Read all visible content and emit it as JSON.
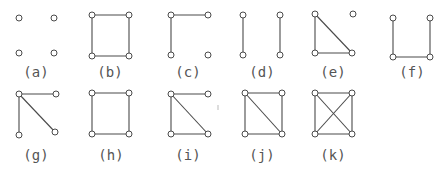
{
  "diagram": {
    "title": "",
    "node_radius": 3,
    "colors": {
      "stroke": "#4a4a4a",
      "node_fill": "#ffffff",
      "label": "#555555",
      "background": "#ffffff"
    },
    "graphs": [
      {
        "id": "a",
        "label": "(a)",
        "label_pos": [
          36,
          77
        ],
        "nodes": [
          [
            19,
            18
          ],
          [
            54,
            18
          ],
          [
            19,
            53
          ],
          [
            54,
            53
          ]
        ],
        "edges": []
      },
      {
        "id": "b",
        "label": "(b)",
        "label_pos": [
          110,
          77
        ],
        "nodes": [
          [
            92,
            15
          ],
          [
            129,
            15
          ],
          [
            92,
            56
          ],
          [
            129,
            56
          ]
        ],
        "edges": [
          [
            0,
            1
          ],
          [
            0,
            2
          ],
          [
            1,
            3
          ],
          [
            2,
            3
          ]
        ]
      },
      {
        "id": "c",
        "label": "(c)",
        "label_pos": [
          188,
          77
        ],
        "nodes": [
          [
            171,
            15
          ],
          [
            208,
            15
          ],
          [
            171,
            55
          ],
          [
            208,
            55
          ]
        ],
        "edges": [
          [
            0,
            1
          ],
          [
            0,
            2
          ]
        ]
      },
      {
        "id": "d",
        "label": "(d)",
        "label_pos": [
          262,
          77
        ],
        "nodes": [
          [
            243,
            15
          ],
          [
            280,
            15
          ],
          [
            243,
            55
          ],
          [
            280,
            55
          ]
        ],
        "edges": [
          [
            0,
            2
          ],
          [
            1,
            3
          ]
        ]
      },
      {
        "id": "e",
        "label": "(e)",
        "label_pos": [
          333,
          77
        ],
        "nodes": [
          [
            315,
            14
          ],
          [
            353,
            14
          ],
          [
            315,
            53
          ],
          [
            352,
            53
          ]
        ],
        "edges": [
          [
            0,
            2
          ],
          [
            0,
            3
          ],
          [
            2,
            3
          ]
        ]
      },
      {
        "id": "f",
        "label": "(f)",
        "label_pos": [
          412,
          77
        ],
        "nodes": [
          [
            393,
            18
          ],
          [
            430,
            18
          ],
          [
            393,
            57
          ],
          [
            430,
            57
          ]
        ],
        "edges": [
          [
            0,
            2
          ],
          [
            2,
            3
          ],
          [
            1,
            3
          ]
        ]
      },
      {
        "id": "g",
        "label": "(g)",
        "label_pos": [
          36,
          160
        ],
        "nodes": [
          [
            19,
            94
          ],
          [
            56,
            94
          ],
          [
            19,
            135
          ],
          [
            55,
            132
          ]
        ],
        "edges": [
          [
            0,
            1
          ],
          [
            0,
            2
          ],
          [
            0,
            3
          ]
        ]
      },
      {
        "id": "h",
        "label": "(h)",
        "label_pos": [
          111,
          160
        ],
        "nodes": [
          [
            92,
            93
          ],
          [
            129,
            93
          ],
          [
            92,
            134
          ],
          [
            129,
            134
          ]
        ],
        "edges": [
          [
            0,
            1
          ],
          [
            0,
            2
          ],
          [
            1,
            3
          ],
          [
            2,
            3
          ]
        ]
      },
      {
        "id": "i",
        "label": "(i)",
        "label_pos": [
          188,
          160
        ],
        "nodes": [
          [
            171,
            94
          ],
          [
            208,
            94
          ],
          [
            171,
            134
          ],
          [
            208,
            134
          ]
        ],
        "edges": [
          [
            0,
            1
          ],
          [
            0,
            2
          ],
          [
            0,
            3
          ],
          [
            2,
            3
          ]
        ]
      },
      {
        "id": "j",
        "label": "(j)",
        "label_pos": [
          262,
          160
        ],
        "nodes": [
          [
            245,
            93
          ],
          [
            282,
            93
          ],
          [
            245,
            134
          ],
          [
            282,
            134
          ]
        ],
        "edges": [
          [
            0,
            1
          ],
          [
            0,
            2
          ],
          [
            1,
            3
          ],
          [
            2,
            3
          ],
          [
            0,
            3
          ]
        ]
      },
      {
        "id": "k",
        "label": "(k)",
        "label_pos": [
          333,
          160
        ],
        "nodes": [
          [
            315,
            93
          ],
          [
            352,
            93
          ],
          [
            315,
            134
          ],
          [
            352,
            134
          ]
        ],
        "edges": [
          [
            0,
            1
          ],
          [
            0,
            2
          ],
          [
            1,
            3
          ],
          [
            2,
            3
          ],
          [
            0,
            3
          ],
          [
            1,
            2
          ]
        ]
      }
    ],
    "stray_marks": [
      {
        "x1": 218,
        "y1": 105,
        "x2": 218,
        "y2": 110
      }
    ]
  }
}
